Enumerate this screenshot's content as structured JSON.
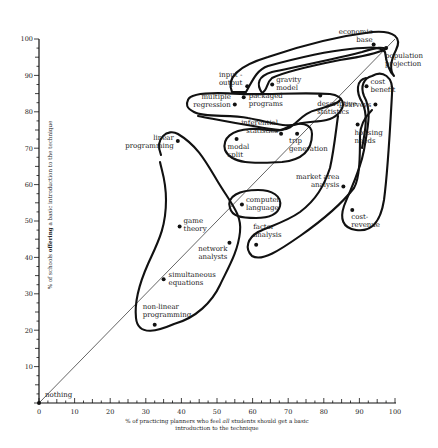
{
  "chart_data": {
    "type": "scatter",
    "title": "",
    "xlabel": "% of practicing planners who feel all students should get a basic introduction to the technique",
    "xlabel_line1_pre": "% of practicing planners who feel ",
    "xlabel_line1_em": "all",
    "xlabel_line1_post": " students should get a basic",
    "xlabel_line2": "introduction to the technique",
    "ylabel": "% of schools offering a basic introduction to the technique",
    "ylabel_pre": "% of schools ",
    "ylabel_em": "offering",
    "ylabel_post": " a basic introduction to the technique",
    "xlim": [
      0,
      100
    ],
    "ylim": [
      0,
      100
    ],
    "xticks": [
      0,
      10,
      20,
      30,
      40,
      50,
      60,
      70,
      80,
      90,
      100
    ],
    "yticks": [
      10,
      20,
      30,
      40,
      50,
      60,
      70,
      80,
      90,
      100
    ],
    "grid": false,
    "reference_line": "y = x diagonal",
    "points": [
      {
        "label": "nothing",
        "x": 0,
        "y": 0
      },
      {
        "label": "economic base",
        "x": 94,
        "y": 98.5
      },
      {
        "label": "population projection",
        "x": 97.5,
        "y": 97.5
      },
      {
        "label": "cost benefit",
        "x": 92,
        "y": 87
      },
      {
        "label": "surveys",
        "x": 94.5,
        "y": 82
      },
      {
        "label": "housing needs",
        "x": 89.5,
        "y": 76.5
      },
      {
        "label": "market area analysis",
        "x": 85.5,
        "y": 59.5
      },
      {
        "label": "cost-revenue",
        "x": 88,
        "y": 53
      },
      {
        "label": "input-output",
        "x": 58.5,
        "y": 87
      },
      {
        "label": "gravity model",
        "x": 65.5,
        "y": 87.5
      },
      {
        "label": "packaged programs",
        "x": 57.5,
        "y": 84
      },
      {
        "label": "multiple regression",
        "x": 55,
        "y": 82
      },
      {
        "label": "descriptive statistics",
        "x": 79,
        "y": 84.5
      },
      {
        "label": "inferential statistics",
        "x": 68,
        "y": 74
      },
      {
        "label": "trip generation",
        "x": 72.5,
        "y": 74
      },
      {
        "label": "modal split",
        "x": 55.5,
        "y": 72.5
      },
      {
        "label": "linear programming",
        "x": 39,
        "y": 72
      },
      {
        "label": "computer language",
        "x": 57,
        "y": 54.5
      },
      {
        "label": "factor analysis",
        "x": 61,
        "y": 43.5
      },
      {
        "label": "game theory",
        "x": 39.5,
        "y": 48.5
      },
      {
        "label": "network analysts",
        "x": 53.5,
        "y": 44
      },
      {
        "label": "simultaneous equations",
        "x": 35,
        "y": 34
      },
      {
        "label": "non-linear programming",
        "x": 32.5,
        "y": 21.5
      }
    ]
  },
  "labels": {
    "nothing": [
      "nothing"
    ],
    "economic_base": [
      "economic",
      "base"
    ],
    "population_projection": [
      "population",
      "projection"
    ],
    "cost_benefit": [
      "cost",
      "benefit"
    ],
    "surveys": [
      "surveys"
    ],
    "housing_needs": [
      "housing",
      "needs"
    ],
    "market_area": [
      "market area",
      "analysis"
    ],
    "cost_revenue": [
      "cost-",
      "revenue"
    ],
    "input_output": [
      "input -",
      "output"
    ],
    "gravity_model": [
      "gravity",
      "model"
    ],
    "packaged_programs": [
      "packaged",
      "programs"
    ],
    "multiple_regression": [
      "multiple",
      "regression"
    ],
    "descriptive_statistics": [
      "descriptive",
      "statistics"
    ],
    "inferential_statistics": [
      "inferential",
      "statistics"
    ],
    "trip_generation": [
      "trip",
      "generation"
    ],
    "modal_split": [
      "modal",
      "split"
    ],
    "linear_programming": [
      "linear",
      "programming"
    ],
    "computer_language": [
      "computer",
      "language"
    ],
    "factor_analysis": [
      "factor",
      "analysis"
    ],
    "game_theory": [
      "game",
      "theory"
    ],
    "network_analysts": [
      "network",
      "analysts"
    ],
    "simultaneous_equations": [
      "simultaneous",
      "equations"
    ],
    "nonlinear_programming": [
      "non-linear",
      "programming"
    ]
  }
}
